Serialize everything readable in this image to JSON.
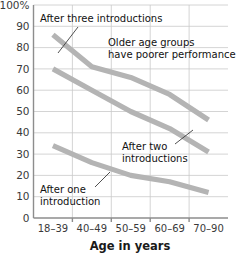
{
  "chart_data": {
    "type": "line",
    "title": "",
    "xlabel": "Age in years",
    "ylabel": "",
    "categories": [
      "18–39",
      "40–49",
      "50–59",
      "60–69",
      "70–90"
    ],
    "ylim": [
      0,
      100
    ],
    "ytick_labels": [
      "0",
      "10",
      "20",
      "30",
      "40",
      "50",
      "60",
      "70",
      "80",
      "90",
      "100%"
    ],
    "ytick_values": [
      0,
      10,
      20,
      30,
      40,
      50,
      60,
      70,
      80,
      90,
      100
    ],
    "grid": true,
    "legend": "none",
    "series": [
      {
        "name": "After three introductions",
        "values": [
          86,
          71,
          66,
          58,
          46
        ],
        "color": "#b4b4b4"
      },
      {
        "name": "After two introductions",
        "values": [
          70,
          60,
          50,
          42,
          31
        ],
        "color": "#b4b4b4"
      },
      {
        "name": "After one introduction",
        "values": [
          34,
          26,
          20,
          17,
          12
        ],
        "color": "#b4b4b4"
      }
    ],
    "annotations": [
      {
        "id": "after-three",
        "lines": [
          "After three introductions"
        ],
        "x": 40,
        "y": 22,
        "anchor": "start"
      },
      {
        "id": "older-age-groups",
        "lines": [
          "Older age groups",
          "have poorer performance"
        ],
        "x": 108,
        "y": 46,
        "anchor": "start"
      },
      {
        "id": "after-two",
        "lines": [
          "After two",
          "introductions"
        ],
        "x": 122,
        "y": 150,
        "anchor": "start"
      },
      {
        "id": "after-one",
        "lines": [
          "After one",
          "introduction"
        ],
        "x": 40,
        "y": 193,
        "anchor": "start"
      }
    ]
  },
  "axis": {
    "x_title": "Age in years"
  },
  "colors": {
    "series": "#b4b4b4",
    "grid": "#c9c9c9",
    "axis": "#8d8d8d",
    "text": "#1a1a1a",
    "background": "#ffffff"
  }
}
